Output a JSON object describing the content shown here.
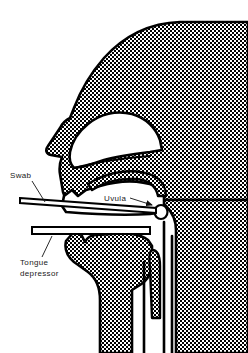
{
  "figure": {
    "kind": "anatomical-line-diagram",
    "view": "lateral sagittal cross-section of head and neck",
    "width": 248,
    "height": 353,
    "background_color": "#ffffff",
    "line_color": "#000000",
    "tissue_fill": "stipple-halftone",
    "tissue_fill_color": "#000000"
  },
  "labels": [
    {
      "id": "swab",
      "text": "Swab",
      "x": 10,
      "y": 178,
      "leader": {
        "from_x": 32,
        "from_y": 181,
        "to_x": 45,
        "to_y": 202,
        "arrow": false
      },
      "points_to": "swab-stick"
    },
    {
      "id": "uvula",
      "text": "Uvula",
      "x": 104,
      "y": 201,
      "leader": {
        "from_x": 130,
        "from_y": 198,
        "to_x": 158,
        "to_y": 205,
        "arrow": true
      },
      "points_to": "uvula-shape"
    },
    {
      "id": "tongue-depressor",
      "text": "Tongue",
      "text_line2": "depressor",
      "x": 20,
      "y": 265,
      "x2": 20,
      "y2": 276,
      "leader": {
        "from_x": 42,
        "from_y": 257,
        "to_x": 52,
        "to_y": 236,
        "arrow": false
      },
      "points_to": "tongue-depressor-stick"
    }
  ],
  "instruments": [
    {
      "id": "swab-stick",
      "name": "Swab",
      "description": "long thin applicator angled slightly downward to the right, tip at the uvula"
    },
    {
      "id": "tongue-depressor-stick",
      "name": "Tongue depressor",
      "description": "flat horizontal blade pressing the tongue downward"
    }
  ],
  "anatomy": [
    {
      "id": "head-outline",
      "name": "head and neck profile"
    },
    {
      "id": "nasal-cavity",
      "name": "nasal cavity"
    },
    {
      "id": "hard-palate",
      "name": "hard palate"
    },
    {
      "id": "soft-palate",
      "name": "soft palate"
    },
    {
      "id": "uvula-shape",
      "name": "uvula"
    },
    {
      "id": "tongue",
      "name": "tongue"
    },
    {
      "id": "mandible",
      "name": "mandible and chin"
    },
    {
      "id": "pharynx",
      "name": "pharynx"
    },
    {
      "id": "epiglottis",
      "name": "epiglottis"
    },
    {
      "id": "larynx-trachea",
      "name": "larynx and trachea"
    }
  ]
}
